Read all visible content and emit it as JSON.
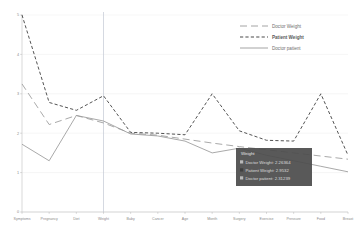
{
  "chart_data": {
    "type": "line",
    "title": "",
    "xlabel": "",
    "ylabel": "",
    "ylim": [
      0,
      5
    ],
    "yticks": [
      "0",
      "1",
      "2",
      "3",
      "4",
      "5"
    ],
    "grid": true,
    "legend_position": "top-right",
    "categories": [
      "Symptoms",
      "Pregnancy",
      "Diet",
      "Weight",
      "Baby",
      "Cancer",
      "Age",
      "Month",
      "Surgery",
      "Exercise",
      "Pressure",
      "Food",
      "Breast"
    ],
    "series": [
      {
        "name": "Doctor Weight",
        "style": "long-dash",
        "color": "#9a9a9a",
        "values": [
          3.25,
          2.22,
          2.45,
          2.26,
          2.0,
          1.95,
          1.85,
          1.75,
          1.66,
          1.58,
          1.5,
          1.42,
          1.34
        ]
      },
      {
        "name": "Patient Weight",
        "style": "dashed",
        "color": "#4a4a4a",
        "values": [
          5.0,
          2.78,
          2.58,
          2.95,
          2.02,
          2.0,
          1.96,
          3.0,
          2.06,
          1.82,
          1.8,
          3.0,
          1.44
        ]
      },
      {
        "name": "Doctor patient",
        "style": "solid",
        "color": "#9a9a9a",
        "values": [
          1.72,
          1.3,
          2.45,
          2.31,
          1.98,
          1.93,
          1.8,
          1.5,
          1.62,
          1.44,
          1.3,
          1.16,
          1.02
        ]
      }
    ]
  },
  "legend": {
    "items": [
      {
        "label": "Doctor Weight",
        "style": "long-dash"
      },
      {
        "label": "Patient Weight",
        "style": "dashed"
      },
      {
        "label": "Doctor patient",
        "style": "solid"
      }
    ]
  },
  "tooltip": {
    "header": "Weight",
    "rows": [
      {
        "label": "Doctor Weight:",
        "value": "2.26364",
        "color": "#b9b9b9"
      },
      {
        "label": "Patient Weight:",
        "value": "2.9532",
        "color": "#3f3f3f"
      },
      {
        "label": "Doctor patient:",
        "value": "2.31239",
        "color": "#b9b9b9"
      }
    ]
  },
  "crosshair": {
    "category": "Weight"
  },
  "axes": {
    "y_ticks": [
      "5",
      "4",
      "3",
      "2",
      "1",
      "0"
    ],
    "x_labels": [
      "Symptoms",
      "Pregnancy",
      "Diet",
      "Weight",
      "Baby",
      "Cancer",
      "Age",
      "Month",
      "Surgery",
      "Exercise",
      "Pressure",
      "Food",
      "Breast"
    ]
  }
}
